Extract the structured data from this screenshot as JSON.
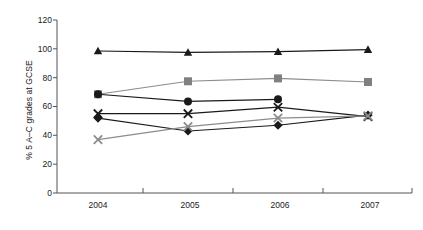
{
  "chart_data": {
    "type": "line",
    "title": "",
    "subtitle": "",
    "xlabel": "",
    "ylabel": "% 5 A–C grades at GCSE",
    "categories": [
      "2004",
      "2005",
      "2006",
      "2007"
    ],
    "x": [
      2004,
      2005,
      2006,
      2007
    ],
    "ylim": [
      0,
      120
    ],
    "yticks": [
      0,
      20,
      40,
      60,
      80,
      100,
      120
    ],
    "ytick_labels": [
      "0",
      "20",
      "40",
      "60",
      "80",
      "100",
      "120"
    ],
    "grid": false,
    "legend": "none",
    "series": [
      {
        "name": "series-triangle",
        "marker": "triangle",
        "color": "#1a1a1a",
        "line_color": "#1a1a1a",
        "values": [
          98.5,
          97.5,
          98.0,
          99.5
        ]
      },
      {
        "name": "series-square",
        "marker": "square",
        "color": "#808080",
        "line_color": "#8c8c8c",
        "values": [
          68.5,
          77.5,
          79.5,
          77.0
        ]
      },
      {
        "name": "series-circle",
        "marker": "circle",
        "color": "#1a1a1a",
        "line_color": "#1a1a1a",
        "values": [
          68.5,
          63.5,
          65.0,
          null
        ]
      },
      {
        "name": "series-cross-black",
        "marker": "x",
        "color": "#1a1a1a",
        "line_color": "#1a1a1a",
        "values": [
          55.0,
          55.0,
          59.5,
          53.0
        ]
      },
      {
        "name": "series-diamond",
        "marker": "diamond",
        "color": "#1a1a1a",
        "line_color": "#1a1a1a",
        "values": [
          52.0,
          43.0,
          47.0,
          54.0
        ]
      },
      {
        "name": "series-cross-grey",
        "marker": "x",
        "color": "#8c8c8c",
        "line_color": "#8c8c8c",
        "values": [
          37.0,
          46.0,
          52.0,
          53.5
        ]
      }
    ]
  },
  "axes": {
    "y_title": "% 5 A–C grades at GCSE",
    "y_labels": [
      "120",
      "100",
      "80",
      "60",
      "40",
      "20",
      "0"
    ],
    "x_labels": [
      "2004",
      "2005",
      "2006",
      "2007"
    ],
    "axis_color": "#555555"
  }
}
